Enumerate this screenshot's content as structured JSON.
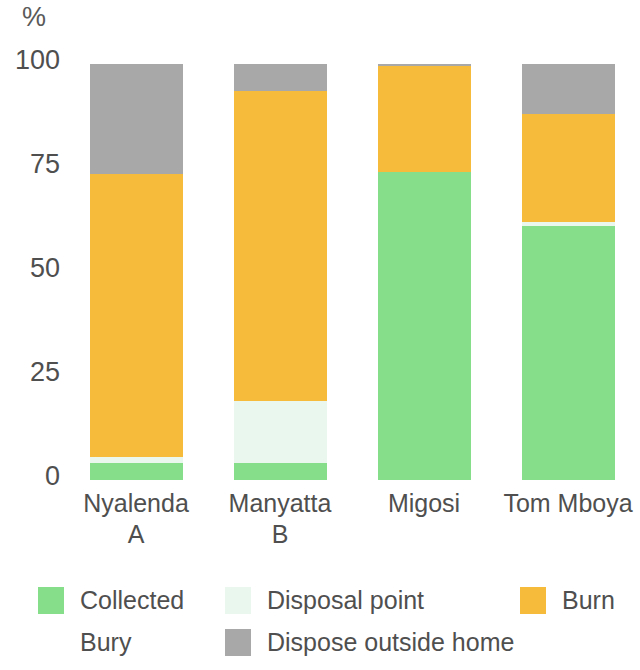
{
  "chart_data": {
    "type": "bar",
    "subtype": "stacked-bar-100",
    "title": "",
    "xlabel": "",
    "ylabel": "%",
    "ylim": [
      0,
      100
    ],
    "yticks": [
      0,
      25,
      50,
      75,
      100
    ],
    "ytick_labels": [
      "0",
      "25",
      "50",
      "75",
      "100"
    ],
    "grid": false,
    "legend_position": "bottom",
    "categories": [
      "Nyalenda A",
      "Manyatta B",
      "Migosi",
      "Tom Mboya"
    ],
    "category_lines": [
      [
        "Nyalenda",
        "A"
      ],
      [
        "Manyatta",
        "B"
      ],
      [
        "Migosi",
        ""
      ],
      [
        "Tom Mboya",
        ""
      ]
    ],
    "series": [
      {
        "name": "Collected",
        "color": "#86dd8a",
        "values": [
          4,
          4,
          74,
          61
        ]
      },
      {
        "name": "Disposal point",
        "color": "#eaf7ee",
        "values": [
          1.5,
          15,
          0,
          1
        ]
      },
      {
        "name": "Burn",
        "color": "#f7bb3c",
        "values": [
          68,
          74.5,
          25.5,
          26
        ]
      },
      {
        "name": "Bury",
        "color": "#ffffff",
        "values": [
          0,
          0,
          0,
          0
        ]
      },
      {
        "name": "Dispose outside home",
        "color": "#a8a8a8",
        "values": [
          26.5,
          6.5,
          0.5,
          12
        ]
      }
    ]
  },
  "axis": {
    "unit_label": "%",
    "ticks": [
      "100",
      "75",
      "50",
      "25",
      "0"
    ]
  },
  "legend": {
    "items": [
      {
        "label": "Collected",
        "color": "#86dd8a"
      },
      {
        "label": "Disposal point",
        "color": "#eaf7ee"
      },
      {
        "label": "Burn",
        "color": "#f7bb3c"
      },
      {
        "label": "Bury",
        "color": "#ffffff"
      },
      {
        "label": "Dispose outside home",
        "color": "#a8a8a8"
      }
    ]
  }
}
